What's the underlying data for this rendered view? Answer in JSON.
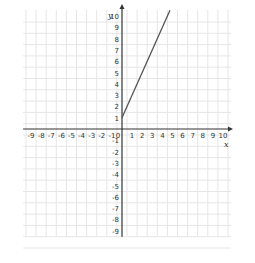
{
  "chart_data": {
    "type": "line",
    "title": "",
    "xlabel": "x",
    "ylabel": "y",
    "xlim": [
      -9,
      10
    ],
    "ylim": [
      -9,
      10
    ],
    "grid": true,
    "x_ticks": [
      "-9",
      "-8",
      "-7",
      "-6",
      "-5",
      "-4",
      "-3",
      "-2",
      "-1",
      "0",
      "1",
      "2",
      "3",
      "4",
      "5",
      "6",
      "7",
      "8",
      "9",
      "10"
    ],
    "y_ticks": [
      "10",
      "9",
      "8",
      "7",
      "6",
      "5",
      "4",
      "3",
      "2",
      "1",
      "-1",
      "-2",
      "-3",
      "-4",
      "-5",
      "-6",
      "-7",
      "-8",
      "-9"
    ],
    "series": [
      {
        "name": "y = 2x + 1",
        "x": [
          0,
          4.75
        ],
        "y": [
          1,
          10.5
        ],
        "color": "#555555"
      }
    ]
  },
  "colors": {
    "axis": "#333333",
    "grid": "#e6e6e6",
    "line": "#555555"
  }
}
